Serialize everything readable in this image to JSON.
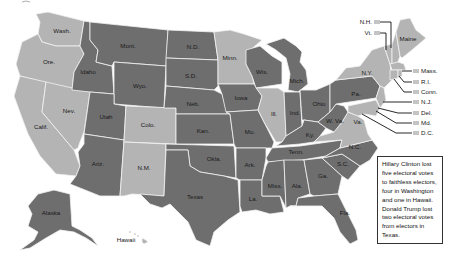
{
  "map": {
    "type": "choropleth",
    "subject": "2016 U.S. presidential election results by state",
    "colors": {
      "trump": "#6e6e6e",
      "clinton": "#b4b4b4",
      "border": "#f2f2f2",
      "label": "#1a1a1a"
    },
    "legend_swatches_color": "#c4c4c4"
  },
  "states": {
    "wash": {
      "label": "Wash.",
      "party": "clinton"
    },
    "ore": {
      "label": "Ore.",
      "party": "clinton"
    },
    "calif": {
      "label": "Calif.",
      "party": "clinton"
    },
    "nev": {
      "label": "Nev.",
      "party": "clinton"
    },
    "idaho": {
      "label": "Idaho",
      "party": "trump"
    },
    "mont": {
      "label": "Mont.",
      "party": "trump"
    },
    "wyo": {
      "label": "Wyo.",
      "party": "trump"
    },
    "utah": {
      "label": "Utah",
      "party": "trump"
    },
    "arIz": {
      "label": "Ariz.",
      "party": "trump"
    },
    "colo": {
      "label": "Colo.",
      "party": "clinton"
    },
    "nm": {
      "label": "N.M.",
      "party": "clinton"
    },
    "nd": {
      "label": "N.D.",
      "party": "trump"
    },
    "sd": {
      "label": "S.D.",
      "party": "trump"
    },
    "neb": {
      "label": "Neb.",
      "party": "trump"
    },
    "kan": {
      "label": "Kan.",
      "party": "trump"
    },
    "okla": {
      "label": "Okla.",
      "party": "trump"
    },
    "texas": {
      "label": "Texas",
      "party": "trump"
    },
    "minn": {
      "label": "Minn.",
      "party": "clinton"
    },
    "iowa": {
      "label": "Iowa",
      "party": "trump"
    },
    "mo": {
      "label": "Mo.",
      "party": "trump"
    },
    "ark": {
      "label": "Ark.",
      "party": "trump"
    },
    "la": {
      "label": "La.",
      "party": "trump"
    },
    "wis": {
      "label": "Wis.",
      "party": "trump"
    },
    "ill": {
      "label": "Ill.",
      "party": "clinton"
    },
    "mich": {
      "label": "Mich.",
      "party": "trump"
    },
    "ind": {
      "label": "Ind.",
      "party": "trump"
    },
    "ohio": {
      "label": "Ohio",
      "party": "trump"
    },
    "ky": {
      "label": "Ky.",
      "party": "trump"
    },
    "tenn": {
      "label": "Tenn.",
      "party": "trump"
    },
    "miss": {
      "label": "Miss.",
      "party": "trump"
    },
    "ala": {
      "label": "Ala.",
      "party": "trump"
    },
    "ga": {
      "label": "Ga.",
      "party": "trump"
    },
    "fla": {
      "label": "Fla.",
      "party": "trump"
    },
    "sc": {
      "label": "S.C.",
      "party": "trump"
    },
    "nc": {
      "label": "N.C.",
      "party": "trump"
    },
    "va": {
      "label": "Va.",
      "party": "clinton"
    },
    "wva": {
      "label": "W. Va.",
      "party": "trump"
    },
    "pa": {
      "label": "Pa.",
      "party": "trump"
    },
    "ny": {
      "label": "N.Y.",
      "party": "clinton"
    },
    "maine": {
      "label": "Maine",
      "party": "clinton"
    },
    "alaska": {
      "label": "Alaska",
      "party": "trump"
    },
    "hawaii": {
      "label": "Hawaii",
      "party": "clinton"
    }
  },
  "callouts": {
    "nh": "N.H.",
    "vt": "Vt.",
    "mass": "Mass.",
    "ri": "R.I.",
    "conn": "Conn.",
    "nj": "N.J.",
    "del": "Del.",
    "md": "Md.",
    "dc": "D.C."
  },
  "note": {
    "text": "Hillary Clinton lost five electoral votes to faithless electors, four in Washington and one in Hawaii. Donald Trump lost two electoral votes from electors in Texas."
  }
}
